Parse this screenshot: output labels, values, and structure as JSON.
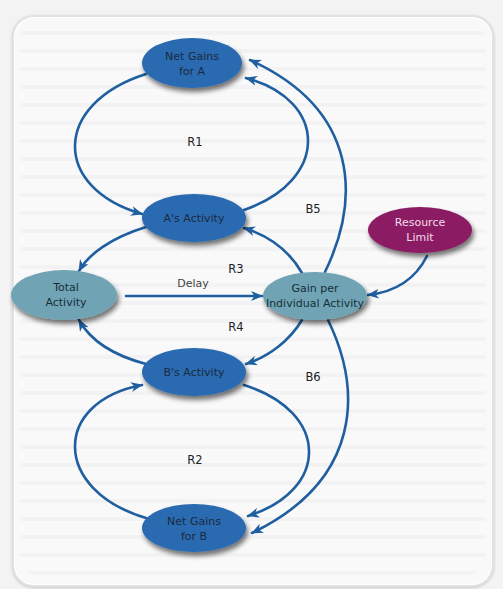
{
  "diagram": {
    "type": "causal-loop",
    "colors": {
      "edge": "#1f5fa0",
      "dark_node": "#2a6bb0",
      "light_node": "#6fa3b3",
      "limit_node": "#8b1f63",
      "dark_node_text": "#1a2a40",
      "light_node_text": "#16303a",
      "limit_node_text": "#f4dcea"
    },
    "nodes": {
      "net_gains_a": {
        "line1": "Net Gains",
        "line2": "for A"
      },
      "a_activity": {
        "line1": "A's Activity"
      },
      "total_activity": {
        "line1": "Total",
        "line2": "Activity"
      },
      "gain_per_activity": {
        "line1": "Gain per",
        "line2": "Individual Activity"
      },
      "resource_limit": {
        "line1": "Resource",
        "line2": "Limit"
      },
      "b_activity": {
        "line1": "B's Activity"
      },
      "net_gains_b": {
        "line1": "Net Gains",
        "line2": "for B"
      }
    },
    "loop_labels": {
      "r1": "R1",
      "r2": "R2",
      "r3": "R3",
      "r4": "R4",
      "b5": "B5",
      "b6": "B6"
    },
    "edge_labels": {
      "delay": "Delay"
    },
    "edges": [
      {
        "from": "Net Gains for A",
        "to": "A's Activity"
      },
      {
        "from": "A's Activity",
        "to": "Net Gains for A"
      },
      {
        "from": "Gain per Individual Activity",
        "to": "Net Gains for A"
      },
      {
        "from": "A's Activity",
        "to": "Total Activity"
      },
      {
        "from": "Gain per Individual Activity",
        "to": "A's Activity"
      },
      {
        "from": "Total Activity",
        "to": "Gain per Individual Activity",
        "label": "Delay"
      },
      {
        "from": "Resource Limit",
        "to": "Gain per Individual Activity"
      },
      {
        "from": "Gain per Individual Activity",
        "to": "B's Activity"
      },
      {
        "from": "B's Activity",
        "to": "Total Activity"
      },
      {
        "from": "Net Gains for B",
        "to": "B's Activity"
      },
      {
        "from": "B's Activity",
        "to": "Net Gains for B"
      },
      {
        "from": "Gain per Individual Activity",
        "to": "Net Gains for B"
      }
    ]
  }
}
